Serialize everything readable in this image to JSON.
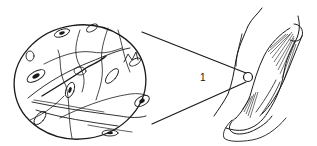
{
  "diagram": {
    "type": "anatomical-magnification-illustration",
    "labels": [
      {
        "id": "1",
        "text": "1",
        "x": 201,
        "y": 73
      }
    ],
    "parts": {
      "magnified_view": {
        "shape": "ellipse",
        "cx": 78,
        "cy": 82,
        "rx": 66,
        "ry": 57
      },
      "arm": {
        "description": "Outline of upper arm with biceps muscle and tendon, bent at the elbow"
      },
      "zoom_point": {
        "cx": 248,
        "cy": 77,
        "r": 5
      },
      "connector_lines": 2
    },
    "colors": {
      "ink": "#1a1a1a",
      "background": "#ffffff"
    }
  }
}
